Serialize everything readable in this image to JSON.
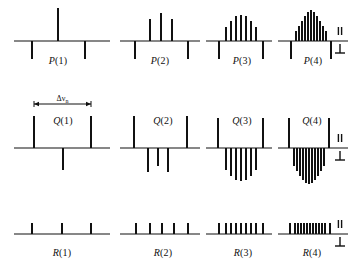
{
  "figure": {
    "title": "",
    "background_color": "#ffffff",
    "ink_color": "#111111",
    "annotation": {
      "label": "Δν",
      "subscript": "n",
      "name": "delta-nu-n-span"
    },
    "polarization_legend": {
      "parallel_symbol": "‖",
      "perpendicular_symbol": "⊥",
      "note": "upward sticks = parallel, downward sticks = perpendicular"
    },
    "rows": [
      {
        "branch": "P",
        "baseline_y": 41,
        "panels": [
          {
            "label_prefix": "P",
            "label_n": "(1)",
            "label_x": 58,
            "label_y": 64
          },
          {
            "label_prefix": "P",
            "label_n": "(2)",
            "label_x": 160,
            "label_y": 64
          },
          {
            "label_prefix": "P",
            "label_n": "(3)",
            "label_x": 242,
            "label_y": 64
          },
          {
            "label_prefix": "P",
            "label_n": "(4)",
            "label_x": 313,
            "label_y": 64
          }
        ]
      },
      {
        "branch": "Q",
        "baseline_y": 148,
        "panels": [
          {
            "label_prefix": "Q",
            "label_n": "(1)",
            "label_x": 63,
            "label_y": 124
          },
          {
            "label_prefix": "Q",
            "label_n": "(2)",
            "label_x": 163,
            "label_y": 124
          },
          {
            "label_prefix": "Q",
            "label_n": "(3)",
            "label_x": 242,
            "label_y": 124
          },
          {
            "label_prefix": "Q",
            "label_n": "(4)",
            "label_x": 312,
            "label_y": 124
          }
        ]
      },
      {
        "branch": "R",
        "baseline_y": 234,
        "panels": [
          {
            "label_prefix": "R",
            "label_n": "(1)",
            "label_x": 62,
            "label_y": 256
          },
          {
            "label_prefix": "R",
            "label_n": "(2)",
            "label_x": 163,
            "label_y": 256
          },
          {
            "label_prefix": "R",
            "label_n": "(3)",
            "label_x": 243,
            "label_y": 256
          },
          {
            "label_prefix": "R",
            "label_n": "(4)",
            "label_x": 312,
            "label_y": 256
          }
        ]
      }
    ]
  },
  "chart_data": {
    "type": "bar",
    "title": "",
    "xlabel": "",
    "ylabel": "",
    "grid": false,
    "legend": [
      "parallel",
      "perpendicular"
    ],
    "legend_position": "right",
    "axis_segments": [
      {
        "row": "P",
        "x0": 14,
        "x1": 110,
        "y": 41
      },
      {
        "row": "P",
        "x0": 120,
        "x1": 200,
        "y": 41
      },
      {
        "row": "P",
        "x0": 206,
        "x1": 272,
        "y": 41
      },
      {
        "row": "P",
        "x0": 278,
        "x1": 348,
        "y": 41
      },
      {
        "row": "Q",
        "x0": 14,
        "x1": 110,
        "y": 148
      },
      {
        "row": "Q",
        "x0": 120,
        "x1": 200,
        "y": 148
      },
      {
        "row": "Q",
        "x0": 206,
        "x1": 272,
        "y": 148
      },
      {
        "row": "Q",
        "x0": 278,
        "x1": 348,
        "y": 148
      },
      {
        "row": "R",
        "x0": 14,
        "x1": 110,
        "y": 234
      },
      {
        "row": "R",
        "x0": 120,
        "x1": 200,
        "y": 234
      },
      {
        "row": "R",
        "x0": 206,
        "x1": 272,
        "y": 234
      },
      {
        "row": "R",
        "x0": 278,
        "x1": 348,
        "y": 234
      }
    ],
    "series": [
      {
        "name": "P(1)",
        "row": "P",
        "lines": [
          {
            "x": 32,
            "h": -18
          },
          {
            "x": 58,
            "h": 33
          },
          {
            "x": 85,
            "h": -18
          }
        ]
      },
      {
        "name": "P(2)",
        "row": "P",
        "lines": [
          {
            "x": 135,
            "h": -18
          },
          {
            "x": 150,
            "h": 22
          },
          {
            "x": 161,
            "h": 28
          },
          {
            "x": 172,
            "h": 22
          },
          {
            "x": 188,
            "h": -18
          }
        ]
      },
      {
        "name": "P(3)",
        "row": "P",
        "lines": [
          {
            "x": 219,
            "h": -18
          },
          {
            "x": 226,
            "h": 14
          },
          {
            "x": 231,
            "h": 20
          },
          {
            "x": 236,
            "h": 25
          },
          {
            "x": 241,
            "h": 26
          },
          {
            "x": 246,
            "h": 25
          },
          {
            "x": 251,
            "h": 20
          },
          {
            "x": 256,
            "h": 14
          },
          {
            "x": 263,
            "h": -18
          }
        ]
      },
      {
        "name": "P(4)",
        "row": "P",
        "lines": [
          {
            "x": 291,
            "h": -18
          },
          {
            "x": 296,
            "h": 10
          },
          {
            "x": 299,
            "h": 15
          },
          {
            "x": 302,
            "h": 20
          },
          {
            "x": 305,
            "h": 25
          },
          {
            "x": 308,
            "h": 29
          },
          {
            "x": 311,
            "h": 31
          },
          {
            "x": 314,
            "h": 29
          },
          {
            "x": 317,
            "h": 25
          },
          {
            "x": 320,
            "h": 20
          },
          {
            "x": 323,
            "h": 15
          },
          {
            "x": 326,
            "h": 10
          },
          {
            "x": 331,
            "h": -18
          }
        ]
      },
      {
        "name": "Q(1)",
        "row": "Q",
        "lines": [
          {
            "x": 34,
            "h": 32
          },
          {
            "x": 63,
            "h": -22
          },
          {
            "x": 91,
            "h": 32
          }
        ]
      },
      {
        "name": "Q(2)",
        "row": "Q",
        "lines": [
          {
            "x": 134,
            "h": 32
          },
          {
            "x": 148,
            "h": -24
          },
          {
            "x": 158,
            "h": -18
          },
          {
            "x": 168,
            "h": -24
          },
          {
            "x": 187,
            "h": 32
          }
        ]
      },
      {
        "name": "Q(3)",
        "row": "Q",
        "lines": [
          {
            "x": 218,
            "h": 30
          },
          {
            "x": 226,
            "h": -22
          },
          {
            "x": 231,
            "h": -28
          },
          {
            "x": 236,
            "h": -32
          },
          {
            "x": 241,
            "h": -33
          },
          {
            "x": 246,
            "h": -32
          },
          {
            "x": 251,
            "h": -28
          },
          {
            "x": 256,
            "h": -22
          },
          {
            "x": 263,
            "h": 30
          }
        ]
      },
      {
        "name": "Q(4)",
        "row": "Q",
        "lines": [
          {
            "x": 289,
            "h": 30
          },
          {
            "x": 294,
            "h": -18
          },
          {
            "x": 297,
            "h": -23
          },
          {
            "x": 300,
            "h": -28
          },
          {
            "x": 303,
            "h": -32
          },
          {
            "x": 306,
            "h": -35
          },
          {
            "x": 309,
            "h": -36
          },
          {
            "x": 312,
            "h": -35
          },
          {
            "x": 315,
            "h": -32
          },
          {
            "x": 318,
            "h": -28
          },
          {
            "x": 321,
            "h": -23
          },
          {
            "x": 324,
            "h": -18
          },
          {
            "x": 329,
            "h": 30
          }
        ]
      },
      {
        "name": "R(1)",
        "row": "R",
        "lines": [
          {
            "x": 32,
            "h": 11
          },
          {
            "x": 62,
            "h": 11
          },
          {
            "x": 91,
            "h": 11
          }
        ]
      },
      {
        "name": "R(2)",
        "row": "R",
        "lines": [
          {
            "x": 136,
            "h": 11
          },
          {
            "x": 150,
            "h": 11
          },
          {
            "x": 162,
            "h": 11
          },
          {
            "x": 174,
            "h": 11
          },
          {
            "x": 188,
            "h": 11
          }
        ]
      },
      {
        "name": "R(3)",
        "row": "R",
        "lines": [
          {
            "x": 219,
            "h": 11
          },
          {
            "x": 226,
            "h": 11
          },
          {
            "x": 231,
            "h": 11
          },
          {
            "x": 236,
            "h": 11
          },
          {
            "x": 241,
            "h": 11
          },
          {
            "x": 246,
            "h": 11
          },
          {
            "x": 251,
            "h": 11
          },
          {
            "x": 256,
            "h": 11
          },
          {
            "x": 263,
            "h": 11
          }
        ]
      },
      {
        "name": "R(4)",
        "row": "R",
        "lines": [
          {
            "x": 290,
            "h": 11
          },
          {
            "x": 295,
            "h": 11
          },
          {
            "x": 298,
            "h": 11
          },
          {
            "x": 301,
            "h": 11
          },
          {
            "x": 304,
            "h": 11
          },
          {
            "x": 307,
            "h": 11
          },
          {
            "x": 310,
            "h": 11
          },
          {
            "x": 313,
            "h": 11
          },
          {
            "x": 316,
            "h": 11
          },
          {
            "x": 319,
            "h": 11
          },
          {
            "x": 322,
            "h": 11
          },
          {
            "x": 325,
            "h": 11
          },
          {
            "x": 330,
            "h": 11
          }
        ]
      }
    ],
    "span_marker": {
      "x0": 34,
      "x1": 91,
      "y": 104,
      "label": "Δν",
      "sub": "n"
    },
    "polarization_markers": [
      {
        "row": "P",
        "x": 340,
        "y": 41
      },
      {
        "row": "Q",
        "x": 340,
        "y": 148
      },
      {
        "row": "R",
        "x": 340,
        "y": 234
      }
    ]
  }
}
